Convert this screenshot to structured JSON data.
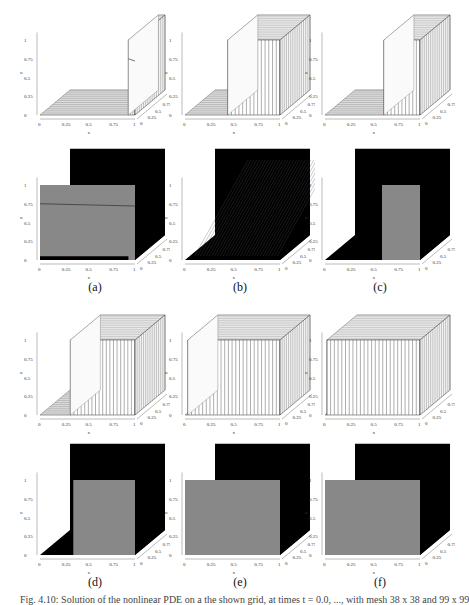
{
  "figure": {
    "panel_labels": [
      "(a)",
      "(b)",
      "(c)",
      "(d)",
      "(e)",
      "(f)"
    ],
    "caption": "Fig. 4.10: Solution of the nonlinear PDE on a the shown grid, at times t = 0.0, ..., with mesh 38 x 38 and 99 x 99"
  },
  "axes": {
    "x_label": "x",
    "y_label": "y",
    "z_label": "u",
    "x_ticks": [
      "0",
      "0.25",
      "0.5",
      "0.75",
      "1"
    ],
    "y_ticks": [
      "0",
      "0.25",
      "0.5",
      "0.75",
      "1"
    ],
    "z_ticks": [
      "0",
      "0.25",
      "0.5",
      "0.75",
      "1"
    ]
  },
  "chart_data": [
    {
      "panel": "a",
      "type": "surface-wireframe",
      "description": "Step profile: u=0 for x<~0.95, jumps to 1 near x=1; horizontal line at u~0.75",
      "xlim": [
        0,
        1
      ],
      "ylim": [
        0,
        1
      ],
      "zlim": [
        0,
        1.2
      ]
    },
    {
      "panel": "a-shaded",
      "type": "surface-shaded",
      "description": "Same as (a), shaded view, gray front face",
      "xlim": [
        0,
        1
      ],
      "ylim": [
        0,
        1
      ],
      "zlim": [
        0,
        1.2
      ]
    },
    {
      "panel": "b",
      "type": "surface-wireframe",
      "description": "Front moving left, diagonal skew across y",
      "xlim": [
        0,
        1
      ],
      "ylim": [
        0,
        1
      ],
      "zlim": [
        0,
        1.2
      ]
    },
    {
      "panel": "b-shaded",
      "type": "surface-shaded",
      "description": "Dark shaded with dense mesh lines",
      "xlim": [
        0,
        1
      ],
      "ylim": [
        0,
        1
      ],
      "zlim": [
        0,
        1.2
      ]
    },
    {
      "panel": "c",
      "type": "surface-wireframe",
      "description": "Front around x~0.6, curved near top",
      "xlim": [
        0,
        1
      ],
      "ylim": [
        0,
        1
      ],
      "zlim": [
        0,
        1.2
      ]
    },
    {
      "panel": "c-shaded",
      "type": "surface-shaded",
      "description": "Gray plateau x~0.6-0.85",
      "xlim": [
        0,
        1
      ],
      "ylim": [
        0,
        1
      ],
      "zlim": [
        0,
        1.2
      ]
    },
    {
      "panel": "d",
      "type": "surface-wireframe",
      "description": "Front around x~0.3",
      "xlim": [
        0,
        1
      ],
      "ylim": [
        0,
        1
      ],
      "zlim": [
        0,
        1.2
      ]
    },
    {
      "panel": "d-shaded",
      "type": "surface-shaded",
      "description": "Gray plateau x~0.35-0.85",
      "xlim": [
        0,
        1
      ],
      "ylim": [
        0,
        1
      ],
      "zlim": [
        0,
        1.2
      ]
    },
    {
      "panel": "e",
      "type": "surface-wireframe",
      "description": "Nearly full plateau u=1 everywhere",
      "xlim": [
        0,
        1
      ],
      "ylim": [
        0,
        1
      ],
      "zlim": [
        0,
        1.2
      ]
    },
    {
      "panel": "e-shaded",
      "type": "surface-shaded",
      "description": "Full gray plateau",
      "xlim": [
        0,
        1
      ],
      "ylim": [
        0,
        1
      ],
      "zlim": [
        0,
        1.2
      ]
    },
    {
      "panel": "f",
      "type": "surface-wireframe",
      "description": "Full plateau u=1",
      "xlim": [
        0,
        1
      ],
      "ylim": [
        0,
        1
      ],
      "zlim": [
        0,
        1.2
      ]
    },
    {
      "panel": "f-shaded",
      "type": "surface-shaded",
      "description": "Full gray plateau",
      "xlim": [
        0,
        1
      ],
      "ylim": [
        0,
        1
      ],
      "zlim": [
        0,
        1.2
      ]
    }
  ]
}
